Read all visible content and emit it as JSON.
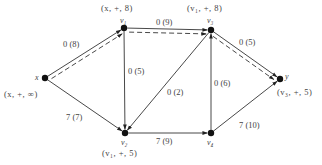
{
  "diagram": {
    "type": "flow-network",
    "nodes": [
      {
        "id": "x",
        "name": "x",
        "label": "(x, +, ∞)",
        "cx": 45,
        "cy": 78
      },
      {
        "id": "v1",
        "name": "v₁",
        "label": "(x, +, 8)",
        "cx": 124,
        "cy": 28
      },
      {
        "id": "v3",
        "name": "v₃",
        "label": "(v₁, +, 8)",
        "cx": 211,
        "cy": 30
      },
      {
        "id": "y",
        "name": "y",
        "label": "(v₃, +, 5)",
        "cx": 280,
        "cy": 79
      },
      {
        "id": "v2",
        "name": "v₂",
        "label": "(v₁, +, 5)",
        "cx": 125,
        "cy": 133
      },
      {
        "id": "v4",
        "name": "v₄",
        "label": "",
        "cx": 211,
        "cy": 133
      }
    ],
    "edges": [
      {
        "from": "x",
        "to": "v1",
        "label": "0 (8)",
        "augmenting": true
      },
      {
        "from": "v1",
        "to": "v3",
        "label": "0 (9)",
        "augmenting": true
      },
      {
        "from": "v3",
        "to": "y",
        "label": "0 (5)",
        "augmenting": true
      },
      {
        "from": "x",
        "to": "v2",
        "label": "7 (7)",
        "augmenting": false
      },
      {
        "from": "v1",
        "to": "v2",
        "label": "0 (5)",
        "augmenting": false
      },
      {
        "from": "v3",
        "to": "v2",
        "label": "0 (2)",
        "augmenting": false
      },
      {
        "from": "v2",
        "to": "v4",
        "label": "7 (9)",
        "augmenting": false
      },
      {
        "from": "v4",
        "to": "v3",
        "label": "0 (6)",
        "augmenting": false
      },
      {
        "from": "v4",
        "to": "y",
        "label": "7 (10)",
        "augmenting": false
      }
    ],
    "colors": {
      "line": "#333333",
      "node": "#111111",
      "text": "#444444"
    }
  }
}
